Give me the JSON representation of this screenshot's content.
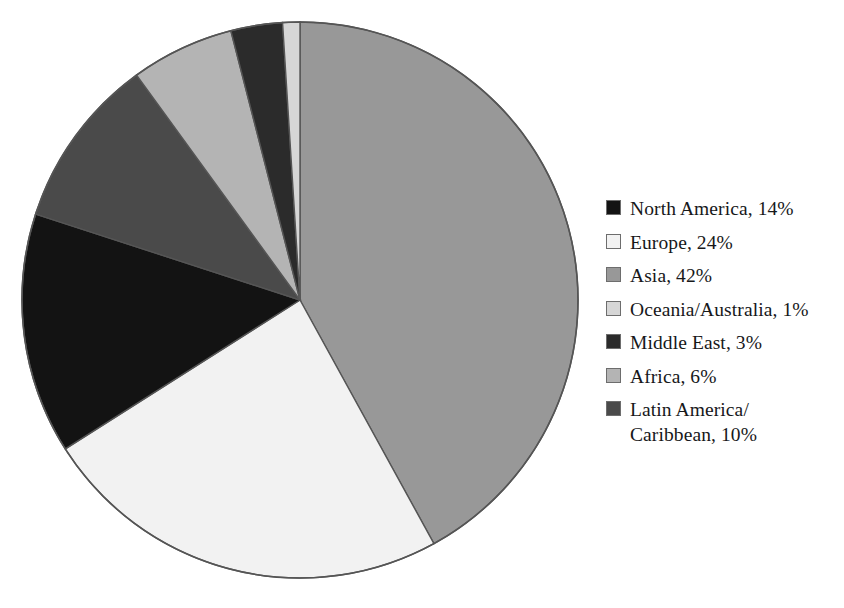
{
  "chart_data": {
    "type": "pie",
    "title": "",
    "subtitle": "",
    "xlabel": "",
    "ylabel": "",
    "grid": false,
    "legend_position": "right",
    "units": "percent",
    "start_angle_deg": 0,
    "direction": "clockwise",
    "categories": [
      "North America",
      "Europe",
      "Asia",
      "Oceania/Australia",
      "Middle East",
      "Africa",
      "Latin America/Caribbean"
    ],
    "values": [
      14,
      24,
      42,
      1,
      3,
      6,
      10
    ],
    "slice_colors": [
      "#131313",
      "#f2f2f2",
      "#989898",
      "#d6d6d6",
      "#2b2b2b",
      "#b4b4b4",
      "#4a4a4a"
    ],
    "slice_order_clockwise_from_top": [
      "Asia",
      "Europe",
      "North America",
      "Latin America/Caribbean",
      "Africa",
      "Middle East",
      "Oceania/Australia"
    ],
    "total": 100
  },
  "pie": {
    "center_x": 282,
    "center_y": 292,
    "radius": 278,
    "outline_color": "#555555",
    "separator_color": "#555555",
    "slices": [
      {
        "name": "Asia",
        "value": 42,
        "label": "Asia, 42%",
        "color": "#989898",
        "start_deg": 0,
        "end_deg": 151.2
      },
      {
        "name": "Europe",
        "value": 24,
        "label": "Europe, 24%",
        "color": "#f2f2f2",
        "start_deg": 151.2,
        "end_deg": 237.6
      },
      {
        "name": "North America",
        "value": 14,
        "label": "North America, 14%",
        "color": "#131313",
        "start_deg": 237.6,
        "end_deg": 288.0
      },
      {
        "name": "Latin America/Caribbean",
        "value": 10,
        "label": "Latin America/Caribbean, 10%",
        "color": "#4a4a4a",
        "start_deg": 288.0,
        "end_deg": 324.0
      },
      {
        "name": "Africa",
        "value": 6,
        "label": "Africa, 6%",
        "color": "#b4b4b4",
        "start_deg": 324.0,
        "end_deg": 345.6
      },
      {
        "name": "Middle East",
        "value": 3,
        "label": "Middle East, 3%",
        "color": "#2b2b2b",
        "start_deg": 345.6,
        "end_deg": 356.4
      },
      {
        "name": "Oceania/Australia",
        "value": 1,
        "label": "Oceania/Australia, 1%",
        "color": "#d6d6d6",
        "start_deg": 356.4,
        "end_deg": 360.0
      }
    ]
  },
  "legend": {
    "items": [
      {
        "label": "North America, 14%",
        "color": "#131313"
      },
      {
        "label": "Europe, 24%",
        "color": "#f2f2f2"
      },
      {
        "label": "Asia, 42%",
        "color": "#989898"
      },
      {
        "label": "Oceania/Australia, 1%",
        "color": "#d6d6d6"
      },
      {
        "label": "Middle East, 3%",
        "color": "#2b2b2b"
      },
      {
        "label": "Africa, 6%",
        "color": "#b4b4b4"
      },
      {
        "label": "Latin America/\nCaribbean, 10%",
        "color": "#4a4a4a"
      }
    ]
  }
}
